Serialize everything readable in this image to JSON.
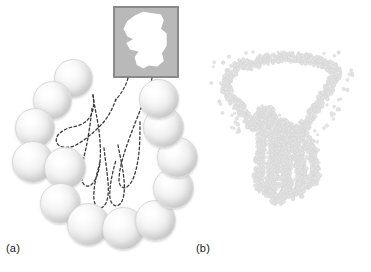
{
  "figure": {
    "background_color": "#ffffff"
  },
  "panels": [
    {
      "id": "a",
      "label": "(a)",
      "description": "Coarse sampling: large sampling apertures arranged around a dashed hand outline",
      "sphere_count": 13,
      "inset": {
        "name": "coarse-hand-image",
        "description": "Blocky low-resolution white hand blob on gray background",
        "fill_color": "#ffffff",
        "background_color": "#b9b9b9",
        "border_color": "#8a8a8a"
      },
      "outline": {
        "name": "dashed-hand-outline",
        "stroke_color": "#3a3a3a",
        "style": "dashed"
      }
    },
    {
      "id": "b",
      "label": "(b)",
      "description": "Fine sampling: many small sampling apertures tracing a detailed hand outline",
      "dot_count": 1400,
      "inset": {
        "name": "fine-hand-image",
        "description": "Sharp white five-finger hand silhouette on gray background",
        "fill_color": "#ffffff",
        "background_color": "#b9b9b9",
        "border_color": "#8a8a8a"
      },
      "dots": {
        "name": "sampling-dots",
        "fill_color": "#e4e4e4",
        "stroke_color": "#d0d0d0"
      }
    }
  ],
  "colors": {
    "sphere_light": "#ffffff",
    "sphere_shade": "#d2d2d2",
    "inset_gray": "#b9b9b9",
    "inset_border": "#8a8a8a",
    "dash_stroke": "#3a3a3a",
    "label_text": "#1a1a1a"
  }
}
